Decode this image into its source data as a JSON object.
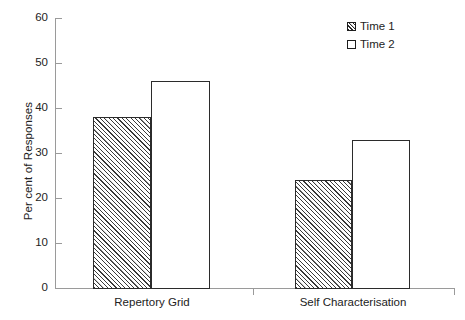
{
  "chart_data": {
    "type": "bar",
    "title": "",
    "subtitle": "",
    "xlabel": "",
    "ylabel": "Per cent of Responses",
    "categories": [
      "Repertory Grid",
      "Self Characterisation"
    ],
    "series": [
      {
        "name": "Time 1",
        "values": [
          38,
          46
        ],
        "fill": "hatched",
        "color": "#ffffff"
      },
      {
        "name": "Time 2",
        "values": [
          24,
          33
        ],
        "fill": "solid-white",
        "color": "#ffffff"
      }
    ],
    "note_series_mapping": "Within each category the left bar is Time 1 style (hatched) and the right bar is Time 2 style (white); plotted values left-to-right are 38, 46, 24, 33",
    "bars": [
      {
        "category": "Repertory Grid",
        "series": "Time 1",
        "value": 38
      },
      {
        "category": "Repertory Grid",
        "series": "Time 2",
        "value": 46
      },
      {
        "category": "Self Characterisation",
        "series": "Time 1",
        "value": 24
      },
      {
        "category": "Self Characterisation",
        "series": "Time 2",
        "value": 33
      }
    ],
    "ylim": [
      0,
      60
    ],
    "ytick_values": [
      0,
      10,
      20,
      30,
      40,
      50,
      60
    ],
    "ytick_labels": [
      "0",
      "10",
      "20",
      "30",
      "40",
      "50",
      "60"
    ],
    "grid": false,
    "legend_position": "top-right",
    "legend": [
      "Time 1",
      "Time 2"
    ],
    "axis_color": "#9a9a9a",
    "bar_outline_color": "#2b2b2b",
    "background": "#ffffff"
  },
  "legend": {
    "items": [
      {
        "label": "Time 1",
        "swatch": "hatched-square-icon"
      },
      {
        "label": "Time 2",
        "swatch": "empty-square-icon"
      }
    ]
  },
  "axes": {
    "y_title": "Per cent of Responses",
    "y_ticks": [
      "60",
      "50",
      "40",
      "30",
      "20",
      "10",
      "0"
    ],
    "x_categories": [
      "Repertory Grid",
      "Self Characterisation"
    ]
  }
}
